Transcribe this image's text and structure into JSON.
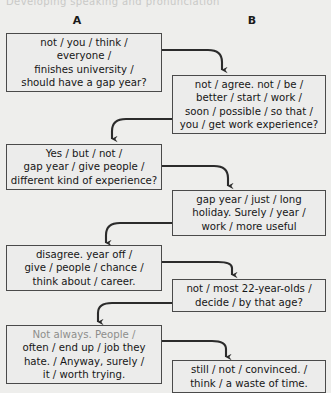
{
  "page": {
    "cut_heading": "Developing speaking and pronunciation",
    "background_color": "#eeeeec",
    "box_border_color": "#4a4a4a",
    "box_fill_color": "#ececeb",
    "arrow_color": "#2b2b2b"
  },
  "columns": [
    {
      "id": "A",
      "label": "A"
    },
    {
      "id": "B",
      "label": "B"
    }
  ],
  "boxes": [
    {
      "id": "a1",
      "column": "A",
      "order": 1,
      "lines": [
        "not / you / think /",
        "everyone /",
        "finishes university /",
        "should have a gap year?"
      ],
      "faded": false
    },
    {
      "id": "b1",
      "column": "B",
      "order": 2,
      "lines": [
        "not / agree. not / be /",
        "better / start / work /",
        "soon / possible / so that /",
        "you / get work experience?"
      ],
      "faded": false
    },
    {
      "id": "a2",
      "column": "A",
      "order": 3,
      "lines": [
        "Yes / but / not /",
        "gap year / give people /",
        "different kind of experience?"
      ],
      "faded": false
    },
    {
      "id": "b2",
      "column": "B",
      "order": 4,
      "lines": [
        "gap year / just / long",
        "holiday. Surely / year /",
        "work / more useful"
      ],
      "faded": false
    },
    {
      "id": "a3",
      "column": "A",
      "order": 5,
      "lines": [
        "disagree. year off /",
        "give / people / chance /",
        "think about / career."
      ],
      "faded": false
    },
    {
      "id": "b3",
      "column": "B",
      "order": 6,
      "lines": [
        "not / most 22-year-olds /",
        "decide / by that age?"
      ],
      "faded": false
    },
    {
      "id": "a4",
      "column": "A",
      "order": 7,
      "lines": [
        "Not always. People /",
        "often / end up / job they",
        "hate. / Anyway, surely /",
        "it / worth trying."
      ],
      "faded": true,
      "faded_lines": [
        0
      ]
    },
    {
      "id": "b4",
      "column": "B",
      "order": 8,
      "lines": [
        "still / not / convinced. /",
        "think /  a waste of time."
      ],
      "faded": false
    }
  ],
  "arrows": [
    {
      "id": "arrow-a1-b1",
      "from": "a1",
      "to": "b1",
      "direction": "right-down"
    },
    {
      "id": "arrow-b1-a2",
      "from": "b1",
      "to": "a2",
      "direction": "left-down"
    },
    {
      "id": "arrow-a2-b2",
      "from": "a2",
      "to": "b2",
      "direction": "right-down"
    },
    {
      "id": "arrow-b2-a3",
      "from": "b2",
      "to": "a3",
      "direction": "left-down"
    },
    {
      "id": "arrow-a3-b3",
      "from": "a3",
      "to": "b3",
      "direction": "right-down"
    },
    {
      "id": "arrow-b3-a4",
      "from": "b3",
      "to": "a4",
      "direction": "left-down"
    },
    {
      "id": "arrow-a4-b4",
      "from": "a4",
      "to": "b4",
      "direction": "right-down"
    }
  ]
}
